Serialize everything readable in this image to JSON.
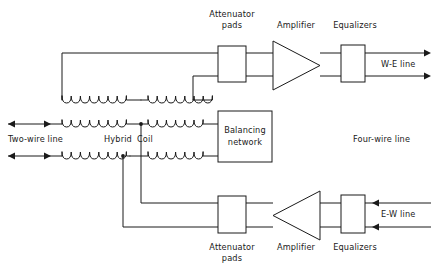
{
  "diagram": {
    "stroke_color": "#1a1a1a",
    "background_color": "#ffffff"
  },
  "labels": {
    "attenuator_top_line1": "Attenuator",
    "attenuator_top_line2": "pads",
    "amplifier_top": "Amplifier",
    "equalizers_top": "Equalizers",
    "we_line": "W-E line",
    "two_wire_line": "Two-wire line",
    "hybrid": "Hybrid",
    "coil": "Coil",
    "balancing_line1": "Balancing",
    "balancing_line2": "network",
    "four_wire_line": "Four-wire line",
    "attenuator_bottom_line1": "Attenuator",
    "attenuator_bottom_line2": "pads",
    "amplifier_bottom": "Amplifier",
    "equalizers_bottom": "Equalizers",
    "ew_line": "E-W line"
  },
  "components": {
    "attenuator_pads_top": {
      "name": "Attenuator pads",
      "shape": "rectangle"
    },
    "amplifier_top": {
      "name": "Amplifier",
      "shape": "triangle",
      "direction": "right"
    },
    "equalizers_top": {
      "name": "Equalizers",
      "shape": "rectangle"
    },
    "balancing_network": {
      "name": "Balancing network",
      "shape": "rectangle"
    },
    "attenuator_pads_bottom": {
      "name": "Attenuator pads",
      "shape": "rectangle"
    },
    "amplifier_bottom": {
      "name": "Amplifier",
      "shape": "triangle",
      "direction": "left"
    },
    "equalizers_bottom": {
      "name": "Equalizers",
      "shape": "rectangle"
    },
    "hybrid_coil": {
      "name": "Hybrid Coil",
      "shape": "coil-windings",
      "winding_count": 6
    }
  },
  "signal_paths": {
    "we_line_direction": "right",
    "ew_line_direction": "left",
    "two_wire_direction": "bidirectional"
  }
}
